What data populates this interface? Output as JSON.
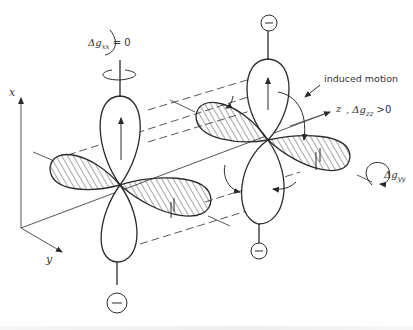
{
  "figure": {
    "labels": {
      "axis_x": "x",
      "axis_y": "y",
      "axis_z": "z",
      "dgxx": "Δg",
      "dgxx_sub": "xx",
      "dgxx_val": " = 0",
      "dgzz_prefix": ",  Δg",
      "dgzz_sub": "zz",
      "dgzz_val": " >0",
      "dgyy": "Δg",
      "dgyy_sub": "yy",
      "induced_motion": "induced motion",
      "minus_sign": "−"
    },
    "colors": {
      "line": "#2b2b2b",
      "hatch": "#3a3a3a",
      "background": "#ffffff"
    }
  }
}
